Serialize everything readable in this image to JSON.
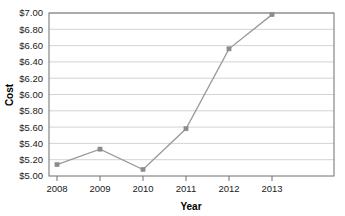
{
  "chart_data": {
    "type": "line",
    "title": "",
    "xlabel": "Year",
    "ylabel": "Cost",
    "categories": [
      "2008",
      "2009",
      "2010",
      "2011",
      "2012",
      "2013"
    ],
    "x": [
      2008,
      2009,
      2010,
      2011,
      2012,
      2013
    ],
    "values": [
      5.14,
      5.33,
      5.08,
      5.58,
      6.56,
      6.98
    ],
    "series": [
      {
        "name": "Cost",
        "values": [
          5.14,
          5.33,
          5.08,
          5.58,
          6.56,
          6.98
        ]
      }
    ],
    "ylim": [
      5.0,
      7.0
    ],
    "ytick_step": 0.2,
    "ytick_labels": [
      "$5.00",
      "$5.20",
      "$5.40",
      "$5.60",
      "$5.80",
      "$6.00",
      "$6.20",
      "$6.40",
      "$6.60",
      "$6.80",
      "$7.00"
    ],
    "ytick_values": [
      5.0,
      5.2,
      5.4,
      5.6,
      5.8,
      6.0,
      6.2,
      6.4,
      6.6,
      6.8,
      7.0
    ],
    "xtick_labels": [
      "2008",
      "2009",
      "2010",
      "2011",
      "2012",
      "2013"
    ],
    "grid": true,
    "grid_axis": "y",
    "legend": false,
    "legend_position": "none",
    "line_color": "#999999",
    "marker_color": "#8c8c8c",
    "grid_color": "#c8c8c8",
    "axis_color": "#6e6e6e",
    "background_color": "#ffffff",
    "marker": "square"
  },
  "plot": {
    "left": 49,
    "right": 334,
    "top": 13,
    "bottom": 176,
    "x_positions": [
      57,
      100,
      143,
      186,
      229,
      272
    ]
  }
}
